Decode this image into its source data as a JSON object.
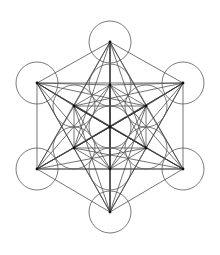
{
  "figure": {
    "title": "Metatron's Cube",
    "type": "sacred-geometry-diagram",
    "background_color": "#ffffff",
    "line_color": "#3a3a3a",
    "circle_stroke_color": "#5a5a5a",
    "node_color": "#111111",
    "line_width": 0.7,
    "circle_stroke_width": 0.8,
    "canvas": {
      "width": 220,
      "height": 255
    },
    "center": {
      "x": 110,
      "y": 127
    },
    "circle_radius": 21,
    "inner_ring_radius": 43,
    "outer_ring_radius": 86,
    "node_dot_radius": 1.4,
    "circle_count": 13,
    "node_count": 13,
    "nodes": [
      {
        "id": "c0",
        "name": "center",
        "ring": "center",
        "x": 110,
        "y": 127
      },
      {
        "id": "i1",
        "name": "inner-top",
        "ring": "inner",
        "x": 110,
        "y": 85
      },
      {
        "id": "i2",
        "name": "inner-upper-right",
        "ring": "inner",
        "x": 146,
        "y": 106
      },
      {
        "id": "i3",
        "name": "inner-lower-right",
        "ring": "inner",
        "x": 146,
        "y": 148
      },
      {
        "id": "i4",
        "name": "inner-bottom",
        "ring": "inner",
        "x": 110,
        "y": 169
      },
      {
        "id": "i5",
        "name": "inner-lower-left",
        "ring": "inner",
        "x": 74,
        "y": 148
      },
      {
        "id": "i6",
        "name": "inner-upper-left",
        "ring": "inner",
        "x": 74,
        "y": 106
      },
      {
        "id": "o1",
        "name": "outer-top",
        "ring": "outer",
        "x": 110,
        "y": 42
      },
      {
        "id": "o2",
        "name": "outer-upper-right",
        "ring": "outer",
        "x": 183,
        "y": 83
      },
      {
        "id": "o3",
        "name": "outer-lower-right",
        "ring": "outer",
        "x": 183,
        "y": 169
      },
      {
        "id": "o4",
        "name": "outer-bottom",
        "ring": "outer",
        "x": 110,
        "y": 212
      },
      {
        "id": "o5",
        "name": "outer-lower-left",
        "ring": "outer",
        "x": 37,
        "y": 169
      },
      {
        "id": "o6",
        "name": "outer-upper-left",
        "ring": "outer",
        "x": 37,
        "y": 83
      }
    ]
  }
}
